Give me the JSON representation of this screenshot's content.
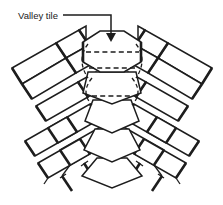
{
  "figure": {
    "kind": "line-diagram",
    "background_color": "#ffffff",
    "line_color": "#1d1d1d",
    "width_px": 223,
    "height_px": 205
  },
  "annotations": {
    "callout": {
      "label": "Valley tile",
      "label_x": 18,
      "label_y": 18,
      "leader": {
        "horizontal_from_x": 63,
        "horizontal_to_x": 111,
        "horizontal_y": 15,
        "vertical_from_y": 15,
        "vertical_to_y": 36,
        "arrow_tip_x": 111,
        "arrow_tip_y": 42,
        "arrow_direction": "down"
      }
    }
  },
  "legend_notes": {
    "solid_lines": "visible tile edges",
    "dashed_lines": "hidden / overlapped tile edges"
  },
  "tiles": {
    "valley_column": {
      "count": 5,
      "description": "central stack of tapering hexagonal valley tiles",
      "items": [
        {
          "name": "valley-tile-1",
          "points": "83,42 100,31 124,31 141,42 141,62 124,72 100,72 83,62"
        },
        {
          "name": "valley-tile-2",
          "points": "88,72 136,72 141,93 112,104 83,93"
        },
        {
          "name": "valley-tile-3",
          "points": "93,100 131,100 139,121 112,133 85,121"
        },
        {
          "name": "valley-tile-4",
          "points": "95,129 129,129 140,150 112,162 84,150"
        },
        {
          "name": "valley-tile-5",
          "points": "97,158 127,158 142,176 112,188 82,176"
        }
      ],
      "hidden_edges": [
        {
          "name": "hidden-edge-upper",
          "x1": 86,
          "y1": 52,
          "x2": 139,
          "y2": 52
        },
        {
          "name": "hidden-edge-lower",
          "x1": 89,
          "y1": 68,
          "x2": 136,
          "y2": 68
        },
        {
          "name": "hidden-edge-mid",
          "x1": 92,
          "y1": 96,
          "x2": 133,
          "y2": 96
        }
      ],
      "hidden_curves": [
        {
          "name": "hidden-curve-left",
          "path": "M88,42 C80,54 80,66 88,78"
        },
        {
          "name": "hidden-curve-left-2",
          "path": "M92,78 C84,88 84,96 92,104"
        },
        {
          "name": "hidden-curve-right",
          "path": "M136,42 C144,54 144,66 136,78"
        },
        {
          "name": "hidden-curve-right-2",
          "path": "M132,78 C140,88 140,96 132,104"
        }
      ]
    },
    "left_field": {
      "rows": 5,
      "description": "rectangular tiles in staggered courses running down-left from the valley"
    },
    "right_field": {
      "rows": 5,
      "description": "rectangular tiles in staggered courses running down-right from the valley"
    }
  }
}
